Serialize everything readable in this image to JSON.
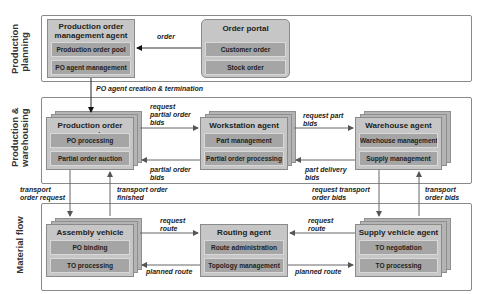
{
  "layers": [
    {
      "label_line1": "Production",
      "label_line2": "planning"
    },
    {
      "label_line1": "Production &",
      "label_line2": "warehousing"
    },
    {
      "label_line1": "Material flow",
      "label_line2": ""
    }
  ],
  "agents": {
    "po_management": {
      "title_line1": "Production order",
      "title_line2": "management agent",
      "subs": [
        "Production order pool",
        "PO agent management"
      ]
    },
    "order_portal": {
      "title": "Order portal",
      "subs": [
        "Customer order",
        "Stock order"
      ]
    },
    "production_order": {
      "title": "Production order agent",
      "subs": [
        "PO processing",
        "Partial order auction"
      ]
    },
    "workstation": {
      "title": "Workstation agent",
      "subs": [
        "Part management",
        "Partial order processing"
      ]
    },
    "warehouse": {
      "title": "Warehouse agent",
      "subs": [
        "Warehouse management",
        "Supply management"
      ]
    },
    "assembly_vehicle": {
      "title": "Assembly vehicle agent",
      "subs": [
        "PO binding",
        "TO processing"
      ]
    },
    "routing": {
      "title": "Routing agent",
      "subs": [
        "Route administration",
        "Topology management"
      ]
    },
    "supply_vehicle": {
      "title": "Supply vehicle agent",
      "subs": [
        "TO negotiation",
        "TO processing"
      ]
    }
  },
  "edges": {
    "order": "order",
    "po_agent_creation": "PO agent creation & termination",
    "request_partial_1": "request",
    "request_partial_2": "partial order",
    "request_partial_3": "bids",
    "partial_bids_1": "partial order",
    "partial_bids_2": "bids",
    "request_part_1": "request part",
    "request_part_2": "bids",
    "part_delivery_1": "part delivery",
    "part_delivery_2": "bids",
    "transport_request_1": "transport",
    "transport_request_2": "order request",
    "transport_finished_1": "transport order",
    "transport_finished_2": "finished",
    "request_transport_bids_1": "request transport",
    "request_transport_bids_2": "order  bids",
    "transport_bids_1": "transport",
    "transport_bids_2": "order bids",
    "request_route_left_1": "request",
    "request_route_left_2": "route",
    "planned_route_left": "planned route",
    "request_route_right_1": "request",
    "request_route_right_2": "route",
    "planned_route_right": "planned route"
  }
}
